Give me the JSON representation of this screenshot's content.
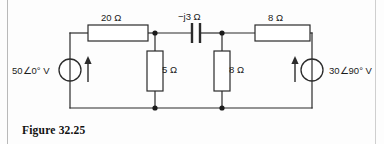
{
  "figure": {
    "caption": "Figure 32.25",
    "line_color": "#2b2b2b",
    "text_color": "#1b1b1b",
    "background": "#fdfdfd"
  },
  "circuit": {
    "sources": [
      {
        "id": "source-left",
        "magnitude": "50",
        "angle_symbol": "∠",
        "angle": "0",
        "degree_symbol": "°",
        "unit": "V",
        "label": "50∠0° V",
        "arrow_direction": "up",
        "arrow_side": "right"
      },
      {
        "id": "source-right",
        "magnitude": "30",
        "angle_symbol": "∠",
        "angle": "90",
        "degree_symbol": "°",
        "unit": "V",
        "label": "30∠90° V",
        "arrow_direction": "up",
        "arrow_side": "left"
      }
    ],
    "components": [
      {
        "id": "resistor-top-left",
        "type": "resistor",
        "value": "20",
        "unit": "Ω",
        "label": "20 Ω",
        "orientation": "horizontal",
        "branch": "top-left"
      },
      {
        "id": "capacitor-top-middle",
        "type": "capacitor",
        "sign": "−",
        "imaginary": "j",
        "value": "3",
        "unit": "Ω",
        "label": "−j3 Ω",
        "orientation": "horizontal",
        "branch": "top-middle"
      },
      {
        "id": "resistor-top-right",
        "type": "resistor",
        "value": "8",
        "unit": "Ω",
        "label": "8 Ω",
        "orientation": "horizontal",
        "branch": "top-right"
      },
      {
        "id": "resistor-shunt-left",
        "type": "resistor",
        "value": "5",
        "unit": "Ω",
        "label": "5 Ω",
        "orientation": "vertical",
        "branch": "shunt-left"
      },
      {
        "id": "resistor-shunt-right",
        "type": "resistor",
        "value": "8",
        "unit": "Ω",
        "label": "8 Ω",
        "orientation": "vertical",
        "branch": "shunt-right"
      }
    ],
    "nodes": [
      {
        "id": "node-top-left",
        "x": 155,
        "y": 33
      },
      {
        "id": "node-top-right",
        "x": 222,
        "y": 33
      },
      {
        "id": "node-bot-left",
        "x": 155,
        "y": 108
      },
      {
        "id": "node-bot-right",
        "x": 222,
        "y": 108
      }
    ]
  }
}
